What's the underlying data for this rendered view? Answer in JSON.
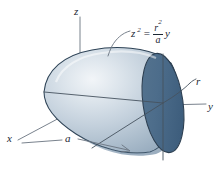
{
  "figure": {
    "background_color": "#ffffff",
    "line_color": "#5a6570",
    "label_color": "#1c2733"
  },
  "axes": [
    {
      "name": "z-axis",
      "label": "z"
    },
    {
      "name": "y-axis",
      "label": "y"
    },
    {
      "name": "x-axis",
      "label": "x"
    }
  ],
  "labels": {
    "z": "z",
    "y": "y",
    "x": "x",
    "r": "r",
    "a": "a"
  },
  "equation": {
    "lhs_base": "z",
    "lhs_exponent": "2",
    "operator": "=",
    "numerator_base": "r",
    "numerator_exponent": "2",
    "denominator": "a",
    "rhs_variable": "y"
  },
  "surface": {
    "name": "paraboloid-surface",
    "body_fill_light": "#e6ecf1",
    "body_fill_mid": "#aebecd",
    "body_fill_dark": "#7f97ad",
    "cap_fill_light": "#6d89a5",
    "cap_fill_dark": "#41607f",
    "outline_color": "#2b3d4f"
  },
  "annotations": [
    {
      "name": "equation-leader-line",
      "target": "paraboloid-surface"
    },
    {
      "name": "dimension-line-a",
      "label": "a",
      "target": "x-axis-extent"
    },
    {
      "name": "radius-leader-line",
      "label": "r",
      "target": "circular-cap-edge"
    }
  ]
}
